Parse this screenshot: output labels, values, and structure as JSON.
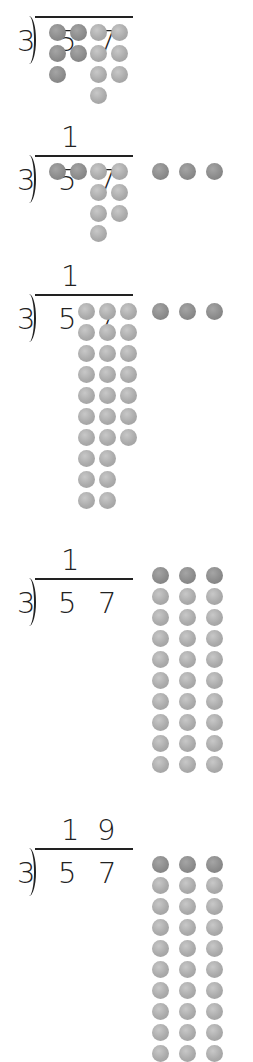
{
  "divisor": "3",
  "dividend_digits": [
    "5",
    "7"
  ],
  "colors": {
    "tens_counter": "#8c8c8c",
    "ones_counter": "#ababab",
    "ink": "#222222"
  },
  "panels": [
    {
      "step": 1,
      "quotient_digits": [
        "",
        ""
      ],
      "description": "57 shown as 5 tens and 7 ones",
      "tens_counters": [
        [
          57,
          32
        ],
        [
          78,
          32
        ],
        [
          57,
          53
        ],
        [
          78,
          53
        ],
        [
          57,
          74
        ]
      ],
      "ones_counters": [
        [
          98,
          32
        ],
        [
          119,
          32
        ],
        [
          98,
          53
        ],
        [
          119,
          53
        ],
        [
          98,
          74
        ],
        [
          119,
          74
        ],
        [
          98,
          95
        ]
      ]
    },
    {
      "step": 2,
      "quotient_digits": [
        "1",
        ""
      ],
      "description": "3 tens shared, 2 tens remain",
      "tens_counters": [
        [
          57,
          171
        ],
        [
          78,
          171
        ],
        [
          160,
          171
        ],
        [
          187,
          171
        ],
        [
          214,
          171
        ]
      ],
      "ones_counters": [
        [
          98,
          171
        ],
        [
          119,
          171
        ],
        [
          98,
          192
        ],
        [
          119,
          192
        ],
        [
          98,
          213
        ],
        [
          119,
          213
        ],
        [
          98,
          233
        ]
      ]
    },
    {
      "step": 3,
      "quotient_digits": [
        "1",
        ""
      ],
      "description": "2 tens regrouped into 20 ones; 27 ones total",
      "tens_counters": [
        [
          160,
          311
        ],
        [
          187,
          311
        ],
        [
          214,
          311
        ]
      ],
      "ones_columns": [
        {
          "x": 86,
          "count": 10
        },
        {
          "x": 107,
          "count": 10
        },
        {
          "x": 128,
          "count": 7
        }
      ],
      "ones_start_y": 311
    },
    {
      "step": 4,
      "quotient_digits": [
        "1",
        ""
      ],
      "description": "27 ones shared into 3 groups of 9",
      "tens_row_y": 575,
      "ones_rows": 9,
      "columns_x": [
        160,
        187,
        214
      ]
    },
    {
      "step": 5,
      "quotient_digits": [
        "1",
        "9"
      ],
      "description": "Each group gets 1 ten and 9 ones: 57 ÷ 3 = 19",
      "tens_row_y": 864,
      "ones_rows": 9,
      "columns_x": [
        160,
        187,
        214
      ]
    }
  ],
  "answer": "19"
}
